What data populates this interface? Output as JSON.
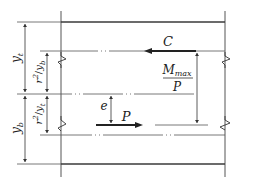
{
  "diagram": {
    "type": "prestressed-beam-section-force-diagram",
    "labels": {
      "y_t": "y",
      "y_t_sub": "t",
      "y_b": "y",
      "y_b_sub": "b",
      "r2_over_yb_num": "r",
      "r2_over_yb_sup": "2",
      "r2_over_yb_den": "y",
      "r2_over_yb_den_sub": "b",
      "r2_over_yt_num": "r",
      "r2_over_yt_sup": "2",
      "r2_over_yt_den": "y",
      "r2_over_yt_den_sub": "t",
      "compression_force": "C",
      "prestress_force": "P",
      "eccentricity": "e",
      "moment_ratio_num": "M",
      "moment_ratio_num_sub": "max",
      "moment_ratio_den": "P"
    },
    "colors": {
      "line": "#3a3a3a",
      "thin_line": "#555555",
      "text": "#222222"
    }
  }
}
